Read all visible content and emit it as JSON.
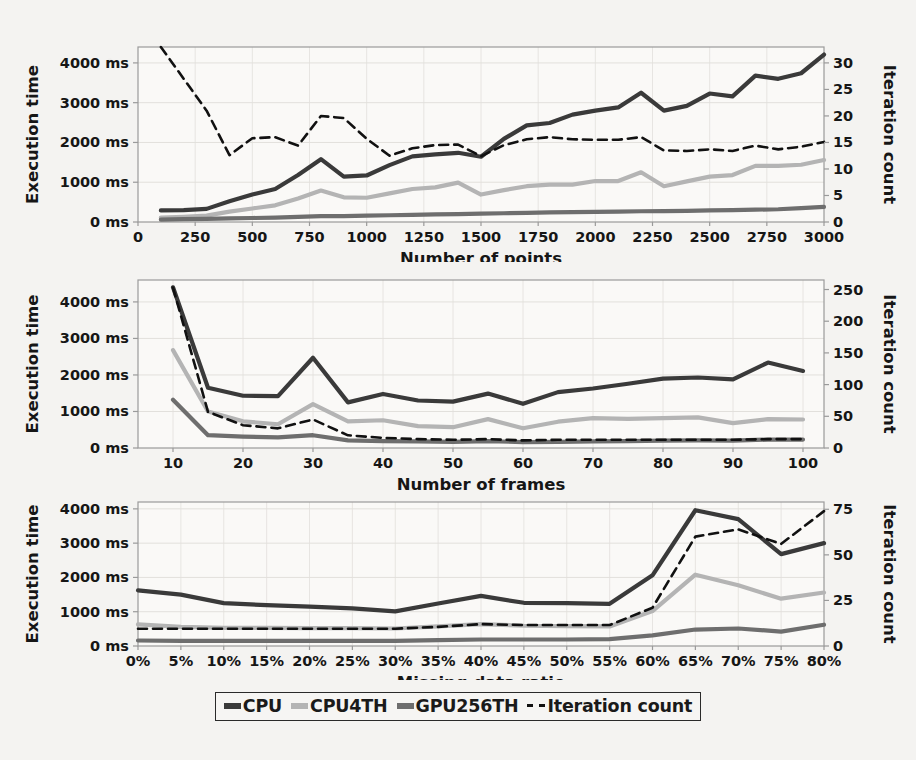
{
  "figure": {
    "background": "#f4f3f1",
    "colors": {
      "cpu": "#3a3a3a",
      "cpu4th": "#b4b4b4",
      "gpu256th": "#6e6e6e",
      "iteration": "#111111",
      "axis": "#9a9a9a",
      "grid": "#e2e0dc",
      "text": "#161616"
    }
  },
  "legend": {
    "items": [
      {
        "label": "CPU",
        "style": "solid",
        "color": "#3a3a3a",
        "swatch": "sw-cpu"
      },
      {
        "label": "CPU4TH",
        "style": "solid",
        "color": "#b4b4b4",
        "swatch": "sw-cpu4"
      },
      {
        "label": "GPU256TH",
        "style": "solid",
        "color": "#6e6e6e",
        "swatch": "sw-gpu"
      },
      {
        "label": "Iteration count",
        "style": "dashed",
        "color": "#111111",
        "swatch": "sw-iter"
      }
    ]
  },
  "chart_data": [
    {
      "type": "line",
      "title": "",
      "xlabel": "Number of points",
      "ylabel": "Execution time",
      "y2label": "Iteration count",
      "xlim": [
        0,
        3000
      ],
      "ylim": [
        0,
        4400
      ],
      "y2lim": [
        0,
        33
      ],
      "grid": true,
      "legend_position": "bottom",
      "xticks": [
        0,
        250,
        500,
        750,
        1000,
        1250,
        1500,
        1750,
        2000,
        2250,
        2500,
        2750,
        3000
      ],
      "xticklabels": [
        "0",
        "250",
        "500",
        "750",
        "1000",
        "1250",
        "1500",
        "1750",
        "2000",
        "2250",
        "2500",
        "2750",
        "3000"
      ],
      "yticks": [
        0,
        1000,
        2000,
        3000,
        4000
      ],
      "yticklabels": [
        "0 ms",
        "1000 ms",
        "2000 ms",
        "3000 ms",
        "4000 ms"
      ],
      "y2ticks": [
        0,
        5,
        10,
        15,
        20,
        25,
        30
      ],
      "y2ticklabels": [
        "0",
        "5",
        "10",
        "15",
        "20",
        "25",
        "30"
      ],
      "x": [
        100,
        200,
        300,
        400,
        500,
        600,
        700,
        800,
        900,
        1000,
        1100,
        1200,
        1300,
        1400,
        1500,
        1600,
        1700,
        1800,
        1900,
        2000,
        2100,
        2200,
        2300,
        2400,
        2500,
        2600,
        2700,
        2800,
        2900,
        3000
      ],
      "series": [
        {
          "name": "CPU",
          "axis": "left",
          "style": "solid",
          "color": "#3a3a3a",
          "values": [
            290,
            300,
            330,
            520,
            690,
            830,
            1180,
            1580,
            1140,
            1170,
            1430,
            1650,
            1700,
            1740,
            1640,
            2090,
            2430,
            2490,
            2700,
            2800,
            2880,
            3250,
            2800,
            2920,
            3230,
            3160,
            3680,
            3600,
            3740,
            4210
          ]
        },
        {
          "name": "CPU4TH",
          "axis": "left",
          "style": "solid",
          "color": "#b4b4b4",
          "values": [
            110,
            130,
            160,
            260,
            340,
            420,
            590,
            790,
            620,
            610,
            720,
            830,
            870,
            990,
            690,
            800,
            900,
            940,
            940,
            1030,
            1030,
            1250,
            900,
            1020,
            1140,
            1180,
            1410,
            1410,
            1440,
            1560
          ]
        },
        {
          "name": "GPU256TH",
          "axis": "left",
          "style": "solid",
          "color": "#6e6e6e",
          "values": [
            60,
            70,
            80,
            90,
            100,
            110,
            130,
            150,
            150,
            160,
            170,
            180,
            190,
            200,
            210,
            220,
            230,
            240,
            250,
            255,
            260,
            270,
            275,
            280,
            290,
            300,
            310,
            320,
            350,
            380
          ]
        },
        {
          "name": "Iteration count",
          "axis": "right",
          "style": "dashed",
          "color": "#111111",
          "values": [
            33,
            27,
            21,
            12.6,
            15.8,
            16,
            14.4,
            20,
            19.6,
            15.7,
            12.5,
            13.9,
            14.5,
            14.6,
            12.4,
            14.5,
            15.6,
            16,
            15.6,
            15.5,
            15.5,
            16,
            13.5,
            13.4,
            13.7,
            13.4,
            14.4,
            13.7,
            14.2,
            15.1
          ]
        }
      ]
    },
    {
      "type": "line",
      "title": "",
      "xlabel": "Number of frames",
      "ylabel": "Execution time",
      "y2label": "Iteration count",
      "xlim": [
        5,
        103
      ],
      "ylim": [
        0,
        4600
      ],
      "y2lim": [
        0,
        265
      ],
      "grid": true,
      "legend_position": "bottom",
      "xticks": [
        10,
        20,
        30,
        40,
        50,
        60,
        70,
        80,
        90,
        100
      ],
      "xticklabels": [
        "10",
        "20",
        "30",
        "40",
        "50",
        "60",
        "70",
        "80",
        "90",
        "100"
      ],
      "yticks": [
        0,
        1000,
        2000,
        3000,
        4000
      ],
      "yticklabels": [
        "0 ms",
        "1000 ms",
        "2000 ms",
        "3000 ms",
        "4000 ms"
      ],
      "y2ticks": [
        0,
        50,
        100,
        150,
        200,
        250
      ],
      "y2ticklabels": [
        "0",
        "50",
        "100",
        "150",
        "200",
        "250"
      ],
      "x": [
        10,
        15,
        20,
        25,
        30,
        35,
        40,
        45,
        50,
        55,
        60,
        65,
        70,
        75,
        80,
        85,
        90,
        95,
        100
      ],
      "series": [
        {
          "name": "CPU",
          "axis": "left",
          "style": "solid",
          "color": "#3a3a3a",
          "values": [
            4400,
            1650,
            1430,
            1420,
            2470,
            1250,
            1480,
            1300,
            1270,
            1490,
            1210,
            1530,
            1630,
            1760,
            1900,
            1930,
            1880,
            2340,
            2110
          ]
        },
        {
          "name": "CPU4TH",
          "axis": "left",
          "style": "solid",
          "color": "#b4b4b4",
          "values": [
            2680,
            1000,
            730,
            650,
            1200,
            730,
            760,
            600,
            570,
            790,
            540,
            720,
            820,
            800,
            820,
            840,
            680,
            790,
            780
          ]
        },
        {
          "name": "GPU256TH",
          "axis": "left",
          "style": "solid",
          "color": "#6e6e6e",
          "values": [
            1320,
            350,
            310,
            290,
            350,
            210,
            190,
            180,
            170,
            190,
            160,
            170,
            180,
            190,
            200,
            210,
            200,
            230,
            230
          ]
        },
        {
          "name": "Iteration count",
          "axis": "right",
          "style": "dashed",
          "color": "#111111",
          "values": [
            253,
            57,
            36,
            31,
            45,
            20,
            16,
            14,
            13,
            14,
            12,
            13,
            13,
            13,
            13,
            13,
            13,
            14,
            14
          ]
        }
      ]
    },
    {
      "type": "line",
      "title": "",
      "xlabel": "Missing data ratio",
      "ylabel": "Execution time",
      "y2label": "Iteration count",
      "xlim": [
        0,
        80
      ],
      "ylim": [
        0,
        4200
      ],
      "y2lim": [
        0,
        79
      ],
      "grid": true,
      "legend_position": "bottom",
      "xticks": [
        0,
        5,
        10,
        15,
        20,
        25,
        30,
        35,
        40,
        45,
        50,
        55,
        60,
        65,
        70,
        75,
        80
      ],
      "xticklabels": [
        "0%",
        "5%",
        "10%",
        "15%",
        "20%",
        "25%",
        "30%",
        "35%",
        "40%",
        "45%",
        "50%",
        "55%",
        "60%",
        "65%",
        "70%",
        "75%",
        "80%"
      ],
      "yticks": [
        0,
        1000,
        2000,
        3000,
        4000
      ],
      "yticklabels": [
        "0 ms",
        "1000 ms",
        "2000 ms",
        "3000 ms",
        "4000 ms"
      ],
      "y2ticks": [
        0,
        25,
        50,
        75
      ],
      "y2ticklabels": [
        "0",
        "25",
        "50",
        "75"
      ],
      "x": [
        0,
        5,
        10,
        15,
        20,
        25,
        30,
        35,
        40,
        45,
        50,
        55,
        60,
        65,
        70,
        75,
        80
      ],
      "series": [
        {
          "name": "CPU",
          "axis": "left",
          "style": "solid",
          "color": "#3a3a3a",
          "values": [
            1620,
            1500,
            1250,
            1190,
            1150,
            1100,
            1010,
            1240,
            1460,
            1260,
            1250,
            1230,
            2060,
            3960,
            3700,
            2680,
            3000
          ]
        },
        {
          "name": "CPU4TH",
          "axis": "left",
          "style": "solid",
          "color": "#b4b4b4",
          "values": [
            630,
            560,
            530,
            530,
            520,
            520,
            510,
            570,
            640,
            590,
            580,
            570,
            1020,
            2080,
            1770,
            1380,
            1560
          ]
        },
        {
          "name": "GPU256TH",
          "axis": "left",
          "style": "solid",
          "color": "#6e6e6e",
          "values": [
            160,
            150,
            150,
            150,
            150,
            150,
            150,
            170,
            190,
            190,
            190,
            200,
            310,
            480,
            510,
            420,
            620
          ]
        },
        {
          "name": "Iteration count",
          "axis": "right",
          "style": "dashed",
          "color": "#111111",
          "values": [
            9.5,
            9.5,
            9.5,
            9.5,
            9.5,
            9.5,
            9.5,
            10.5,
            12,
            11.5,
            11.5,
            11.5,
            21,
            60,
            64,
            56,
            74
          ]
        }
      ]
    }
  ]
}
